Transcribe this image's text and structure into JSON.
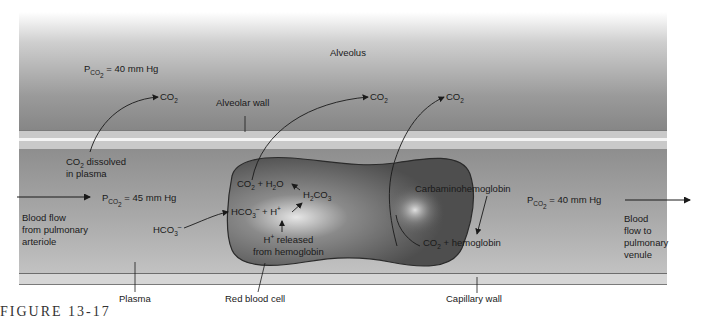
{
  "diagram": {
    "regions": {
      "alveolus": "Alveolus",
      "alveolar_wall": "Alveolar wall",
      "plasma": "Plasma",
      "red_blood_cell": "Red blood cell",
      "capillary_wall": "Capillary wall"
    },
    "pressures": {
      "alveolus": {
        "symbol": "P",
        "sub": "CO",
        "sub2": "2",
        "value": "= 40 mm Hg"
      },
      "arteriole": {
        "symbol": "P",
        "sub": "CO",
        "sub2": "2",
        "value": "= 45 mm Hg"
      },
      "venule": {
        "symbol": "P",
        "sub": "CO",
        "sub2": "2",
        "value": "= 40 mm Hg"
      }
    },
    "co2_outputs": [
      {
        "base": "CO",
        "sub": "2"
      },
      {
        "base": "CO",
        "sub": "2"
      },
      {
        "base": "CO",
        "sub": "2"
      }
    ],
    "plasma_labels": {
      "dissolved_line1_base": "CO",
      "dissolved_line1_sub": "2",
      "dissolved_line1_rest": " dissolved",
      "dissolved_line2": "in plasma",
      "bicarbonate_base": "HCO",
      "bicarbonate_sub": "3",
      "bicarbonate_sup": "–"
    },
    "flow": {
      "in_line1": "Blood flow",
      "in_line2": "from pulmonary",
      "in_line3": "arteriole",
      "out_line1": "Blood",
      "out_line2": "flow to",
      "out_line3": "pulmonary",
      "out_line4": "venule"
    },
    "reactions": {
      "co2_h2o": {
        "a": "CO",
        "a_sub": "2",
        "plus": " + H",
        "b_sub": "2",
        "b_rest": "O"
      },
      "carbonic_acid": {
        "a": "H",
        "a_sub": "2",
        "b": "CO",
        "b_sub": "3"
      },
      "dissociation": {
        "a": "HCO",
        "a_sub": "3",
        "a_sup": "–",
        "plus": " + H",
        "b_sup": "+"
      },
      "h_released_line1": "H",
      "h_released_line1_sup": "+",
      "h_released_line1_rest": " released",
      "h_released_line2": "from hemoglobin",
      "carbamino": "Carbaminohemoglobin",
      "co2_hb": {
        "a": "CO",
        "a_sub": "2",
        "rest": " + hemoglobin"
      }
    },
    "caption": "FIGURE 13-17"
  },
  "colors": {
    "alveolus_top": "#ffffff",
    "alveolus_bottom": "#858585",
    "wall": "#c9c9c9",
    "plasma": "#a0a0a0",
    "rbc_dark": "#555555",
    "rbc_highlight": "#e0e0e0",
    "line": "#1a1a1a"
  }
}
